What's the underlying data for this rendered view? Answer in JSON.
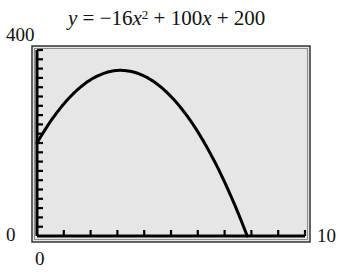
{
  "chart_data": {
    "type": "line",
    "equation": {
      "a": -16,
      "b": 100,
      "c": 200
    },
    "xlabel": "",
    "ylabel": "",
    "xlim": [
      0,
      10
    ],
    "ylim": [
      0,
      400
    ],
    "x_tick_labels": {
      "min": "0",
      "max": "10"
    },
    "y_tick_labels": {
      "min": "0",
      "max": "400"
    },
    "x_tick_count": 10,
    "y_tick_count": 20,
    "grid": false,
    "background_color": "#e6e6e6",
    "series": [
      {
        "name": "y = −16x² + 100x + 200",
        "x": [
          0,
          1,
          2,
          3,
          3.125,
          4,
          5,
          6,
          7,
          7.91
        ],
        "y": [
          200,
          284,
          336,
          356,
          356.25,
          344,
          300,
          224,
          116,
          0
        ]
      }
    ]
  },
  "labels": {
    "y_max": "400",
    "y_min": "0",
    "x_min": "0",
    "x_max": "10",
    "title_prefix": "y = −16",
    "title_x1": "x",
    "title_exp": "2",
    "title_mid": " + 100",
    "title_x2": "x",
    "title_suffix": " + 200"
  }
}
